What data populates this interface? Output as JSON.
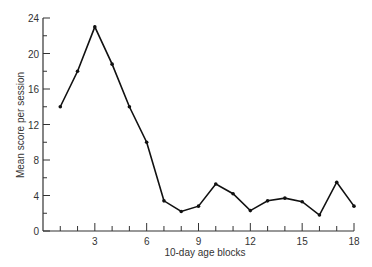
{
  "chart_data": {
    "type": "line",
    "title": "",
    "xlabel": "10-day age blocks",
    "ylabel": "Mean score per session",
    "x": [
      1,
      2,
      3,
      4,
      5,
      6,
      7,
      8,
      9,
      10,
      11,
      12,
      13,
      14,
      15,
      16,
      17,
      18
    ],
    "values": [
      14,
      18,
      23,
      18.8,
      14,
      10,
      3.4,
      2.2,
      2.8,
      5.3,
      4.2,
      2.3,
      3.4,
      3.7,
      3.3,
      1.8,
      5.5,
      2.8
    ],
    "xticks": [
      3,
      6,
      9,
      12,
      15,
      18
    ],
    "yticks": [
      0,
      4,
      8,
      12,
      16,
      20,
      24
    ],
    "xlim": [
      0,
      18
    ],
    "ylim": [
      0,
      24
    ],
    "grid": false
  }
}
